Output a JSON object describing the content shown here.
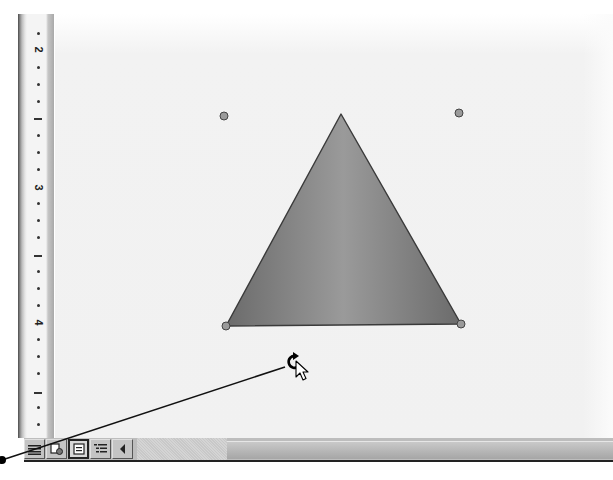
{
  "ruler": {
    "orientation": "vertical",
    "numbers": [
      {
        "label": "2",
        "y": 50
      },
      {
        "label": "1",
        "y": 118
      },
      {
        "label": "3",
        "y": 188
      },
      {
        "label": "1",
        "y": 255
      },
      {
        "label": "4",
        "y": 323
      },
      {
        "label": "1",
        "y": 392
      }
    ]
  },
  "shape": {
    "type": "isosceles-triangle",
    "fill_gradient": [
      "#6b6b6b",
      "#9a9a9a",
      "#6b6b6b"
    ],
    "stroke": "#3a3a3a",
    "vertices": {
      "apex": [
        341,
        114
      ],
      "bottom_left": [
        226,
        326
      ],
      "bottom_right": [
        461,
        324
      ]
    },
    "handles": [
      {
        "name": "top-left",
        "x": 224,
        "y": 116
      },
      {
        "name": "top-right",
        "x": 459,
        "y": 113
      },
      {
        "name": "bottom-left",
        "x": 226,
        "y": 326
      },
      {
        "name": "bottom-right",
        "x": 461,
        "y": 324
      }
    ]
  },
  "cursor": {
    "type": "free-rotate",
    "x": 292,
    "y": 362
  },
  "callout": {
    "from": [
      2,
      460
    ],
    "to": [
      285,
      367
    ]
  },
  "statusbar": {
    "view_buttons": [
      {
        "name": "normal-view",
        "icon": "lines-icon",
        "pressed": false
      },
      {
        "name": "web-layout-view",
        "icon": "web-page-icon",
        "pressed": false
      },
      {
        "name": "print-layout-view",
        "icon": "page-icon",
        "pressed": true
      },
      {
        "name": "outline-view",
        "icon": "outline-icon",
        "pressed": false
      },
      {
        "name": "scroll-left",
        "icon": "arrow-left-icon",
        "pressed": false
      }
    ]
  }
}
